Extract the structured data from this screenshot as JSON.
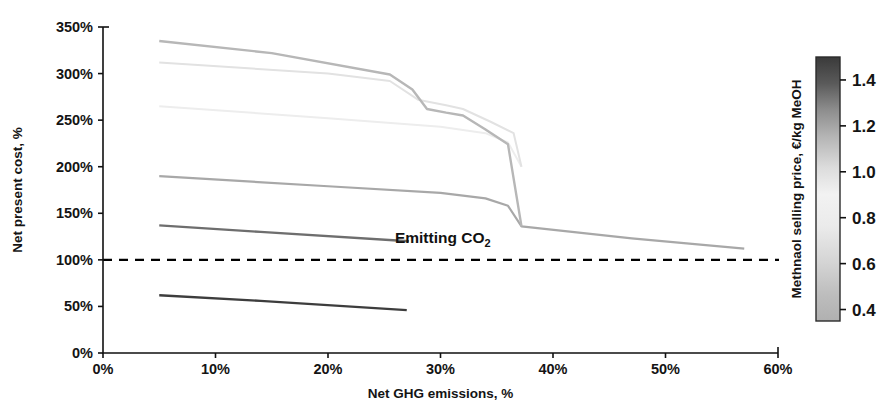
{
  "chart_data": {
    "type": "line",
    "title": "",
    "xlabel": "Net GHG emissions, %",
    "ylabel": "Net present cost, %",
    "xlim": [
      0,
      60
    ],
    "ylim": [
      0,
      350
    ],
    "xticks": [
      0,
      10,
      20,
      30,
      40,
      50,
      60
    ],
    "xticklabels": [
      "0%",
      "10%",
      "20%",
      "30%",
      "40%",
      "50%",
      "60%"
    ],
    "yticks": [
      0,
      50,
      100,
      150,
      200,
      250,
      300,
      350
    ],
    "yticklabels": [
      "0%",
      "50%",
      "100%",
      "150%",
      "200%",
      "250%",
      "300%",
      "350%"
    ],
    "grid": false,
    "legend": "colorbar-right",
    "reference_line": {
      "name": "break-even-line",
      "y": 100,
      "style": "dashed",
      "color": "#000000"
    },
    "annotations": [
      {
        "name": "emitting-co2-label",
        "text": "Emitting CO",
        "subscript": "2",
        "x": 30.2,
        "y": 118
      }
    ],
    "colorbar": {
      "label": "Methnaol selling price, €/kg MeOH",
      "ticks": [
        0.4,
        0.6,
        0.8,
        1.0,
        1.2,
        1.4
      ],
      "ticklabels": [
        "0.4",
        "0.6",
        "0.8",
        "1.0",
        "1.2",
        "1.4"
      ],
      "vmin": 0.35,
      "vmax": 1.5,
      "stops": [
        {
          "pos": 0.0,
          "color": "#b0b0b0"
        },
        {
          "pos": 0.1,
          "color": "#bdbdbd"
        },
        {
          "pos": 0.22,
          "color": "#d4d4d4"
        },
        {
          "pos": 0.36,
          "color": "#ebebeb"
        },
        {
          "pos": 0.48,
          "color": "#f2f2f2"
        },
        {
          "pos": 0.58,
          "color": "#dcdcdc"
        },
        {
          "pos": 0.7,
          "color": "#b4b4b4"
        },
        {
          "pos": 0.8,
          "color": "#8d8d8d"
        },
        {
          "pos": 0.9,
          "color": "#5a5a5a"
        },
        {
          "pos": 1.0,
          "color": "#3a3a3a"
        }
      ]
    },
    "series": [
      {
        "name": "meoh-price-1.45",
        "value": 1.45,
        "color": "#3d3d3d",
        "width": 2.4,
        "points": [
          [
            5.0,
            62
          ],
          [
            14.0,
            56
          ],
          [
            27.0,
            46
          ]
        ]
      },
      {
        "name": "meoh-price-1.15",
        "value": 1.15,
        "color": "#6e6e6e",
        "width": 2.4,
        "points": [
          [
            5.0,
            137
          ],
          [
            14.0,
            130
          ],
          [
            27.2,
            120
          ]
        ]
      },
      {
        "name": "meoh-price-0.92",
        "value": 0.92,
        "color": "#a8a8a8",
        "width": 2.2,
        "points": [
          [
            5.0,
            190
          ],
          [
            20.0,
            179
          ],
          [
            30.0,
            172
          ],
          [
            34.0,
            166
          ],
          [
            36.0,
            158
          ],
          [
            37.2,
            136
          ],
          [
            47.0,
            123
          ],
          [
            57.0,
            112
          ]
        ]
      },
      {
        "name": "meoh-price-0.73",
        "value": 0.73,
        "color": "#ededed",
        "width": 2.0,
        "points": [
          [
            5.0,
            265
          ],
          [
            20.0,
            252
          ],
          [
            30.0,
            243
          ],
          [
            34.0,
            236
          ],
          [
            36.0,
            226
          ],
          [
            37.2,
            200
          ]
        ]
      },
      {
        "name": "meoh-price-0.60",
        "value": 0.6,
        "color": "#e2e2e2",
        "width": 2.0,
        "points": [
          [
            5.0,
            312
          ],
          [
            20.0,
            300
          ],
          [
            25.5,
            292
          ],
          [
            28.0,
            272
          ],
          [
            30.5,
            266
          ],
          [
            32.0,
            262
          ],
          [
            34.5,
            248
          ],
          [
            36.5,
            236
          ],
          [
            37.2,
            200
          ]
        ]
      },
      {
        "name": "meoh-price-0.45",
        "value": 0.45,
        "color": "#b7b7b7",
        "width": 2.4,
        "points": [
          [
            5.0,
            335
          ],
          [
            15.0,
            322
          ],
          [
            25.5,
            299
          ],
          [
            27.5,
            283
          ],
          [
            28.8,
            262
          ],
          [
            30.5,
            258
          ],
          [
            32.0,
            255
          ],
          [
            34.0,
            240
          ],
          [
            36.0,
            224
          ],
          [
            37.2,
            136
          ]
        ]
      }
    ]
  },
  "layout": {
    "plot": {
      "left": 103,
      "right": 778,
      "top": 27,
      "bottom": 353
    },
    "colorbar": {
      "left": 816,
      "right": 840,
      "top": 57,
      "bottom": 321
    }
  }
}
